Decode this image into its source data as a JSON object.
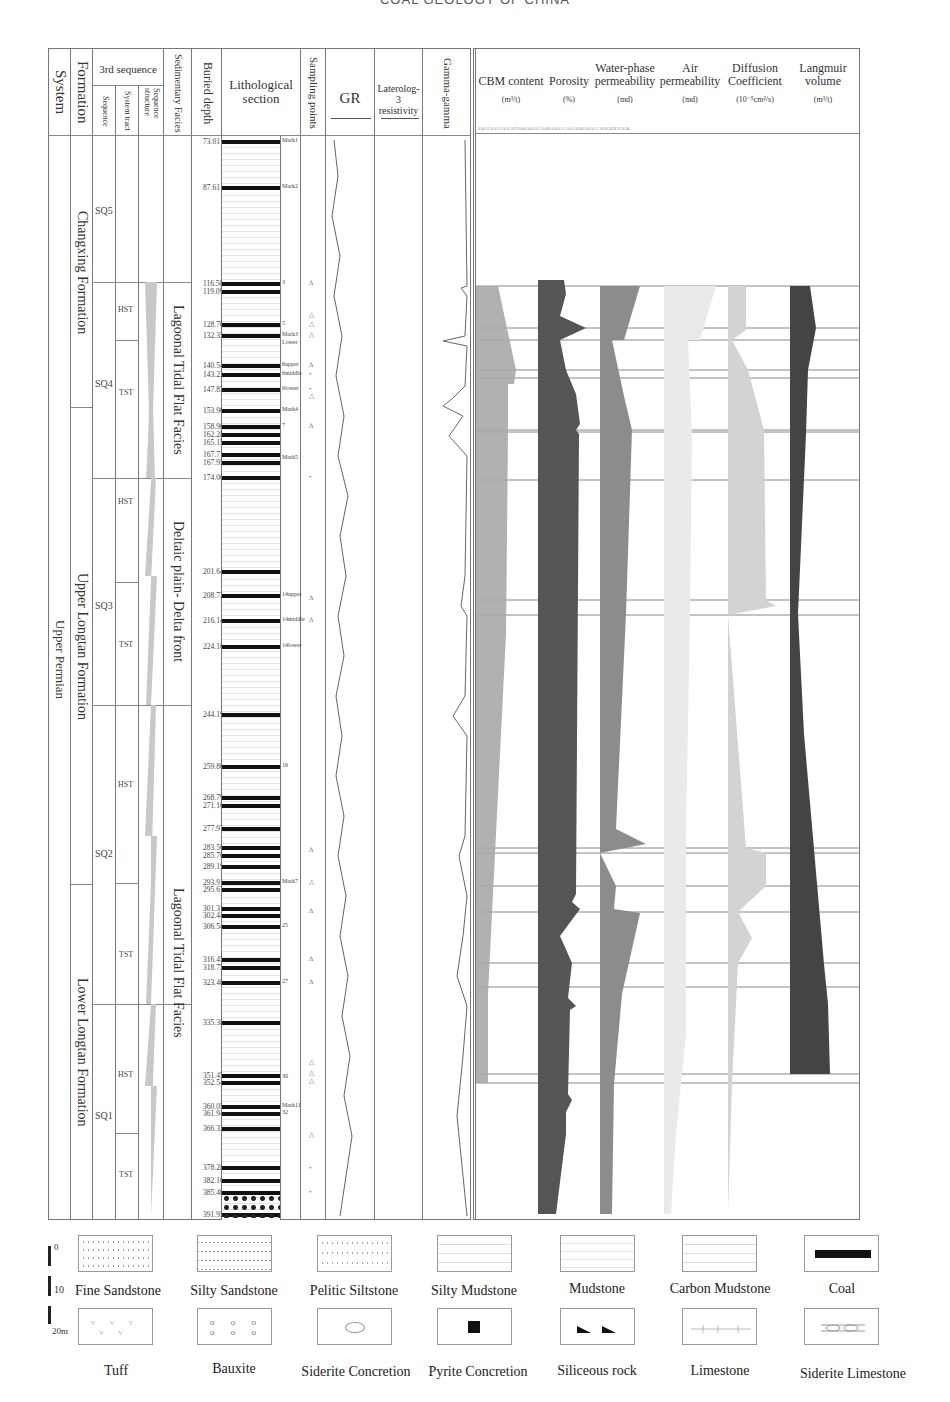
{
  "page_title": "COAL GEOLOGY OF CHINA",
  "headers": {
    "system": "System",
    "formation": "Formation",
    "third_sequence": "3rd  sequence",
    "sequence": "Sequence",
    "system_tract": "System tract",
    "sequence_structure": "Sequence structure",
    "sedimentary_facies": "Sedimentary Facies",
    "buried_depth": "Buried  depth",
    "lithological_section_1": "Lithological",
    "lithological_section_2": "section",
    "sampling_points": "Sampling points",
    "gr": "GR",
    "laterolog_1": "Laterolog-3",
    "laterolog_2": "resistivity",
    "gamma_gamma": "Gamma-gamma"
  },
  "parameter_headers": [
    {
      "title_1": "",
      "title_2": "CBM  content",
      "unit": "(m³/t)"
    },
    {
      "title_1": "",
      "title_2": "Porosity",
      "unit": "(%)"
    },
    {
      "title_1": "Water-phase",
      "title_2": "permeability",
      "unit": "(md)"
    },
    {
      "title_1": "Air",
      "title_2": "permeability",
      "unit": "(md)"
    },
    {
      "title_1": "Diffusion",
      "title_2": "Coefficient",
      "unit": "(10⁻⁵cm²/s)"
    },
    {
      "title_1": "Langmuir",
      "title_2": "volume",
      "unit": "(m³/t)"
    }
  ],
  "axis_ticks": "0  4  8  12  16  4  12  14  16  18  19  0.001 0.01 0.1 1  0.001 0.01 0.1 1  10 0.1 0.001 0.01 0.1 1  10 20 24 28 32 36 40",
  "system": "Upper  Permian",
  "formations": [
    {
      "name": "Changxing  Formation"
    },
    {
      "name": "Upper  Longtan  Formation"
    },
    {
      "name": "Lower  Longtan  Formation"
    }
  ],
  "sequences": [
    {
      "name": "SQ5"
    },
    {
      "name": "SQ4"
    },
    {
      "name": "SQ3"
    },
    {
      "name": "SQ2"
    },
    {
      "name": "SQ1"
    }
  ],
  "system_tracts": [
    {
      "name": "HST"
    },
    {
      "name": "TST"
    },
    {
      "name": "HST"
    },
    {
      "name": "TST"
    },
    {
      "name": "HST"
    },
    {
      "name": "TST"
    },
    {
      "name": "HST"
    },
    {
      "name": "TST"
    }
  ],
  "facies": [
    {
      "name": "Lagoonal  Tidal  Flat  Facies"
    },
    {
      "name": "Deltaic  plain-  Delta  front"
    },
    {
      "name": "Lagoonal  Tidal  Flat  Facies"
    }
  ],
  "depths": [
    {
      "v": "73.01",
      "y": 141
    },
    {
      "v": "87.61",
      "y": 187
    },
    {
      "v": "116.50",
      "y": 283
    },
    {
      "v": "119.09",
      "y": 291
    },
    {
      "v": "128.70",
      "y": 324
    },
    {
      "v": "132.35",
      "y": 335
    },
    {
      "v": "140.54",
      "y": 365
    },
    {
      "v": "143.23",
      "y": 374
    },
    {
      "v": "147.83",
      "y": 389
    },
    {
      "v": "153.90",
      "y": 410
    },
    {
      "v": "158.90",
      "y": 426
    },
    {
      "v": "162.28",
      "y": 434
    },
    {
      "v": "165.15",
      "y": 442
    },
    {
      "v": "167.71",
      "y": 454
    },
    {
      "v": "167.95",
      "y": 462
    },
    {
      "v": "174.00",
      "y": 477
    },
    {
      "v": "201.64",
      "y": 571
    },
    {
      "v": "208.72",
      "y": 595
    },
    {
      "v": "216.14",
      "y": 620
    },
    {
      "v": "224.16",
      "y": 646
    },
    {
      "v": "244.19",
      "y": 714
    },
    {
      "v": "259.80",
      "y": 766
    },
    {
      "v": "268.79",
      "y": 797
    },
    {
      "v": "271.16",
      "y": 805
    },
    {
      "v": "277.97",
      "y": 828
    },
    {
      "v": "283.56",
      "y": 847
    },
    {
      "v": "285.76",
      "y": 855
    },
    {
      "v": "289.19",
      "y": 866
    },
    {
      "v": "293.91",
      "y": 882
    },
    {
      "v": "295.67",
      "y": 889
    },
    {
      "v": "301.31",
      "y": 908
    },
    {
      "v": "302.44",
      "y": 915
    },
    {
      "v": "306.54",
      "y": 926
    },
    {
      "v": "316.45",
      "y": 959
    },
    {
      "v": "318.75",
      "y": 967
    },
    {
      "v": "323.40",
      "y": 982
    },
    {
      "v": "335.38",
      "y": 1022
    },
    {
      "v": "351.45",
      "y": 1075
    },
    {
      "v": "352.54",
      "y": 1082
    },
    {
      "v": "360.05",
      "y": 1106
    },
    {
      "v": "361.94",
      "y": 1113
    },
    {
      "v": "366.33",
      "y": 1128
    },
    {
      "v": "378.28",
      "y": 1167
    },
    {
      "v": "382.10",
      "y": 1180
    },
    {
      "v": "385.40",
      "y": 1192
    },
    {
      "v": "391.95",
      "y": 1214
    }
  ],
  "seam_marks": [
    {
      "v": "Mark1",
      "y": 141
    },
    {
      "v": "Mark2",
      "y": 187
    },
    {
      "v": "3",
      "y": 283
    },
    {
      "v": "5",
      "y": 324
    },
    {
      "v": "Mark3",
      "y": 335
    },
    {
      "v": "Lower",
      "y": 343
    },
    {
      "v": "6upper",
      "y": 365
    },
    {
      "v": "6middle",
      "y": 374
    },
    {
      "v": "6lower",
      "y": 389
    },
    {
      "v": "Mark4",
      "y": 410
    },
    {
      "v": "7",
      "y": 426
    },
    {
      "v": "Mark5",
      "y": 458
    },
    {
      "v": "14upper",
      "y": 595
    },
    {
      "v": "14middle",
      "y": 620
    },
    {
      "v": "14lower",
      "y": 646
    },
    {
      "v": "16",
      "y": 766
    },
    {
      "v": "Mark7",
      "y": 882
    },
    {
      "v": "25",
      "y": 926
    },
    {
      "v": "27",
      "y": 982
    },
    {
      "v": "30",
      "y": 1077
    },
    {
      "v": "Mark11",
      "y": 1106
    },
    {
      "v": "32",
      "y": 1113
    }
  ],
  "sampling_points": [
    {
      "s": "∆",
      "y": 283
    },
    {
      "s": "△",
      "y": 315
    },
    {
      "s": "△",
      "y": 324
    },
    {
      "s": "△",
      "y": 335
    },
    {
      "s": "∆",
      "y": 365
    },
    {
      "s": "•",
      "y": 374
    },
    {
      "s": "•",
      "y": 389
    },
    {
      "s": "△",
      "y": 396
    },
    {
      "s": "∆",
      "y": 426
    },
    {
      "s": "•",
      "y": 477
    },
    {
      "s": "∆",
      "y": 598
    },
    {
      "s": "∆",
      "y": 620
    },
    {
      "s": "∆",
      "y": 850
    },
    {
      "s": "△",
      "y": 882
    },
    {
      "s": "∆",
      "y": 911
    },
    {
      "s": "∆",
      "y": 959
    },
    {
      "s": "∆",
      "y": 982
    },
    {
      "s": "△",
      "y": 1062
    },
    {
      "s": "△",
      "y": 1073
    },
    {
      "s": "△",
      "y": 1081
    },
    {
      "s": "△",
      "y": 1135
    },
    {
      "s": "•",
      "y": 1168
    },
    {
      "s": "•",
      "y": 1192
    }
  ],
  "chart_data": {
    "type": "area",
    "ylabel": "Buried depth (m)",
    "ylim": [
      73.01,
      391.95
    ],
    "series": [
      {
        "name": "CBM content",
        "unit": "m3/t",
        "color": "#a8a8a8"
      },
      {
        "name": "Porosity",
        "unit": "%",
        "color": "#555555"
      },
      {
        "name": "Water-phase permeability",
        "unit": "md",
        "color": "#8c8c8c"
      },
      {
        "name": "Air permeability",
        "unit": "md",
        "color": "#eeeeee"
      },
      {
        "name": "Diffusion Coefficient",
        "unit": "10^-5 cm2/s",
        "color": "#d3d3d3"
      },
      {
        "name": "Langmuir volume",
        "unit": "m3/t",
        "color": "#444444"
      }
    ]
  },
  "legend": {
    "scale": {
      "top": "0",
      "mid": "10",
      "bottom": "20m"
    },
    "items": [
      {
        "label": "Fine  Sandstone"
      },
      {
        "label": "Silty  Sandstone"
      },
      {
        "label": "Pelitic  Siltstone"
      },
      {
        "label": "Silty  Mudstone"
      },
      {
        "label": "Mudstone"
      },
      {
        "label": "Carbon  Mudstone"
      },
      {
        "label": "Coal"
      },
      {
        "label": "Tuff"
      },
      {
        "label": "Bauxite"
      },
      {
        "label": "Siderite  Concretion"
      },
      {
        "label": "Pyrite  Concretion"
      },
      {
        "label": "Siliceous  rock"
      },
      {
        "label": "Limestone"
      },
      {
        "label": "Siderite  Limestone"
      }
    ]
  }
}
